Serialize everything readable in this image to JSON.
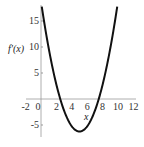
{
  "chart_data": {
    "type": "line",
    "title": "",
    "xlabel": "x",
    "ylabel": "f'(x)",
    "xlim": [
      -2,
      12
    ],
    "ylim": [
      -7,
      18
    ],
    "x_ticks": [
      "-2",
      "0",
      "2",
      "4",
      "6",
      "8",
      "10",
      "12"
    ],
    "y_ticks": [
      "-5",
      "5",
      "10",
      "15"
    ],
    "grid": false,
    "legend": null,
    "series": [
      {
        "name": "f'(x)",
        "x": [
          0,
          1,
          2,
          2.5,
          3,
          4,
          5,
          6,
          7,
          7.5,
          8,
          9,
          10
        ],
        "values": [
          18.75,
          9.75,
          2.75,
          0,
          -2.25,
          -5.25,
          -6.25,
          -5.25,
          -2.25,
          0,
          2.75,
          9.75,
          18.75
        ]
      }
    ]
  }
}
